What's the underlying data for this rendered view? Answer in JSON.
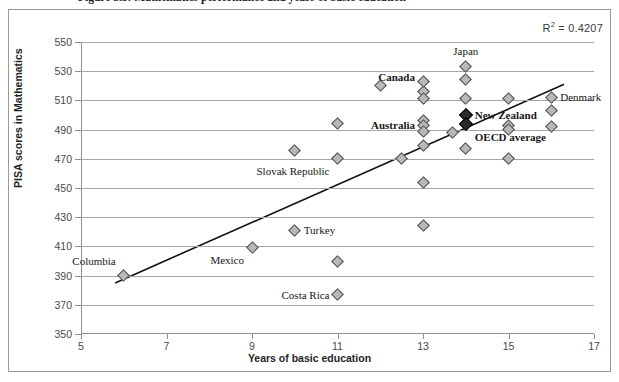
{
  "figure": {
    "caption": "Figure 3.3: Mathematics performance and years of basic education",
    "r2_prefix": "R",
    "r2_sup": "2",
    "r2_value": " = 0.4207"
  },
  "chart_data": {
    "type": "scatter",
    "title": "Figure 3.3: Mathematics performance and years of basic education",
    "xlabel": "Years of basic education",
    "ylabel": "PISA scores in Mathematics",
    "xlim": [
      5,
      17
    ],
    "ylim": [
      350,
      550
    ],
    "xticks": [
      5,
      7,
      9,
      11,
      13,
      15,
      17
    ],
    "yticks": [
      350,
      370,
      390,
      410,
      430,
      450,
      470,
      490,
      510,
      530,
      550
    ],
    "grid": true,
    "legend": "none",
    "r_squared": 0.4207,
    "annotations": [
      {
        "text": "R² = 0.4207",
        "x": 16.2,
        "y": 560
      }
    ],
    "trendline": {
      "x": [
        5.8,
        16.3
      ],
      "y": [
        385,
        521
      ]
    },
    "points": [
      {
        "label": "Columbia",
        "x": 6.0,
        "y": 390,
        "highlight": false,
        "label_pos": "above-left"
      },
      {
        "label": "Mexico",
        "x": 9.0,
        "y": 409,
        "highlight": false,
        "label_pos": "below-left"
      },
      {
        "label": "",
        "x": 10.0,
        "y": 476,
        "highlight": false,
        "label_pos": "none"
      },
      {
        "label": "Turkey",
        "x": 10.0,
        "y": 421,
        "highlight": false,
        "label_pos": "right"
      },
      {
        "label": "",
        "x": 11.0,
        "y": 400,
        "highlight": false,
        "label_pos": "none"
      },
      {
        "label": "Costa Rica",
        "x": 11.0,
        "y": 377,
        "highlight": false,
        "label_pos": "left"
      },
      {
        "label": "",
        "x": 11.0,
        "y": 494,
        "highlight": false,
        "label_pos": "none"
      },
      {
        "label": "Slovak Republic",
        "x": 11.0,
        "y": 470,
        "highlight": false,
        "label_pos": "left-below"
      },
      {
        "label": "",
        "x": 12.0,
        "y": 520,
        "highlight": false,
        "label_pos": "none"
      },
      {
        "label": "Canada",
        "x": 13.0,
        "y": 516,
        "highlight": false,
        "label_pos": "above-left"
      },
      {
        "label": "",
        "x": 13.0,
        "y": 523,
        "highlight": false,
        "label_pos": "none"
      },
      {
        "label": "",
        "x": 13.0,
        "y": 511,
        "highlight": false,
        "label_pos": "none"
      },
      {
        "label": "",
        "x": 13.0,
        "y": 496,
        "highlight": false,
        "label_pos": "none"
      },
      {
        "label": "Australia",
        "x": 13.0,
        "y": 493,
        "highlight": false,
        "label_pos": "left"
      },
      {
        "label": "",
        "x": 13.0,
        "y": 489,
        "highlight": false,
        "label_pos": "none"
      },
      {
        "label": "",
        "x": 13.0,
        "y": 479,
        "highlight": false,
        "label_pos": "none"
      },
      {
        "label": "",
        "x": 13.0,
        "y": 454,
        "highlight": false,
        "label_pos": "none"
      },
      {
        "label": "",
        "x": 13.0,
        "y": 424,
        "highlight": false,
        "label_pos": "none"
      },
      {
        "label": "",
        "x": 12.5,
        "y": 470,
        "highlight": false,
        "label_pos": "none"
      },
      {
        "label": "Japan",
        "x": 14.0,
        "y": 533,
        "highlight": false,
        "label_pos": "above"
      },
      {
        "label": "",
        "x": 14.0,
        "y": 524,
        "highlight": false,
        "label_pos": "none"
      },
      {
        "label": "",
        "x": 14.0,
        "y": 511,
        "highlight": false,
        "label_pos": "none"
      },
      {
        "label": "New Zealand",
        "x": 14.0,
        "y": 500,
        "highlight": true,
        "label_pos": "right"
      },
      {
        "label": "OECD average",
        "x": 14.0,
        "y": 494,
        "highlight": true,
        "label_pos": "right-below"
      },
      {
        "label": "",
        "x": 14.0,
        "y": 477,
        "highlight": false,
        "label_pos": "none"
      },
      {
        "label": "",
        "x": 13.7,
        "y": 488,
        "highlight": false,
        "label_pos": "none"
      },
      {
        "label": "",
        "x": 15.0,
        "y": 511,
        "highlight": false,
        "label_pos": "none"
      },
      {
        "label": "",
        "x": 15.0,
        "y": 493,
        "highlight": false,
        "label_pos": "none"
      },
      {
        "label": "",
        "x": 15.0,
        "y": 490,
        "highlight": false,
        "label_pos": "none"
      },
      {
        "label": "",
        "x": 15.0,
        "y": 470,
        "highlight": false,
        "label_pos": "none"
      },
      {
        "label": "Denmark",
        "x": 16.0,
        "y": 512,
        "highlight": false,
        "label_pos": "right"
      },
      {
        "label": "",
        "x": 16.0,
        "y": 503,
        "highlight": false,
        "label_pos": "none"
      },
      {
        "label": "",
        "x": 16.0,
        "y": 492,
        "highlight": false,
        "label_pos": "none"
      }
    ]
  }
}
